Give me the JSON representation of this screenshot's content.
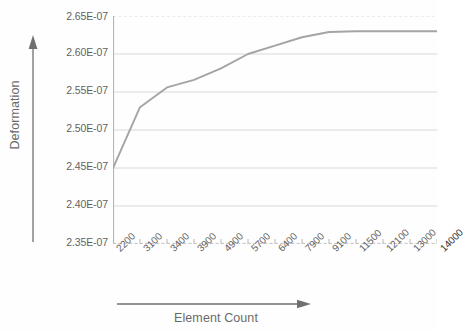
{
  "chart_data": {
    "type": "line",
    "title": "",
    "xlabel": "Element Count",
    "ylabel": "Deformation",
    "categories": [
      "2200",
      "3100",
      "3400",
      "3900",
      "4900",
      "5700",
      "6400",
      "7900",
      "9100",
      "11500",
      "12100",
      "13000",
      "14000"
    ],
    "values": [
      2.45e-07,
      2.53e-07,
      2.556e-07,
      2.566e-07,
      2.581e-07,
      2.6e-07,
      2.611e-07,
      2.622e-07,
      2.629e-07,
      2.63e-07,
      2.63e-07,
      2.63e-07,
      2.63e-07
    ],
    "value_labels": [
      "2.450E-07",
      "2.530E-07",
      "2.556E-07",
      "2.566E-07",
      "2.581E-07",
      "2.600E-07",
      "2.611E-07",
      "2.622E-07",
      "2.629E-07",
      "2.630E-07",
      "2.630E-07",
      "2.630E-07",
      "2.630E-07"
    ],
    "ylim": [
      2.35e-07,
      2.65e-07
    ],
    "y_ticks": [
      2.65e-07,
      2.6e-07,
      2.55e-07,
      2.5e-07,
      2.45e-07,
      2.4e-07,
      2.35e-07
    ],
    "y_tick_labels": [
      "2.65E-07",
      "2.60E-07",
      "2.55E-07",
      "2.50E-07",
      "2.45E-07",
      "2.40E-07",
      "2.35E-07"
    ],
    "grid": true,
    "grid_axis": "y",
    "legend": false,
    "legend_position": "none",
    "series_color": "#8c8c8c",
    "grid_color": "#c9c9c9",
    "axis_color": "#9a9a9a",
    "background": "#ffffff"
  },
  "axes": {
    "y_title": "Deformation",
    "x_title": "Element Count",
    "y_arrow_icon": "arrow-up-icon",
    "x_arrow_icon": "arrow-right-icon"
  }
}
